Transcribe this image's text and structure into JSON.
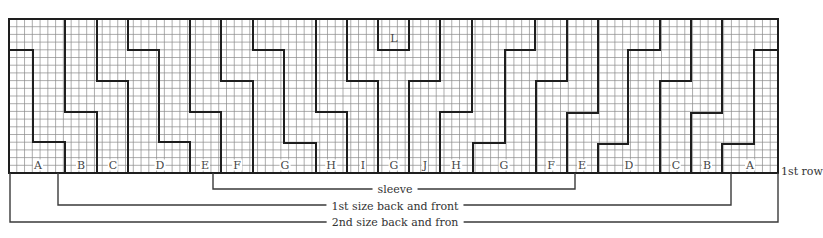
{
  "diagram": {
    "grid": {
      "x0": 9,
      "y0": 19,
      "x1": 778,
      "y1": 173,
      "cols": 99,
      "rows": 20,
      "line_color": "#8a8a8a",
      "heavy_color": "#1e1e1e"
    },
    "column_labels": [
      {
        "text": "A",
        "x": 38
      },
      {
        "text": "B",
        "x": 81
      },
      {
        "text": "C",
        "x": 113
      },
      {
        "text": "D",
        "x": 160
      },
      {
        "text": "E",
        "x": 205
      },
      {
        "text": "F",
        "x": 237
      },
      {
        "text": "G",
        "x": 285
      },
      {
        "text": "H",
        "x": 331
      },
      {
        "text": "I",
        "x": 363
      },
      {
        "text": "G",
        "x": 394
      },
      {
        "text": "J",
        "x": 425
      },
      {
        "text": "H",
        "x": 456
      },
      {
        "text": "G",
        "x": 504
      },
      {
        "text": "F",
        "x": 551
      },
      {
        "text": "E",
        "x": 582
      },
      {
        "text": "D",
        "x": 629
      },
      {
        "text": "C",
        "x": 676
      },
      {
        "text": "B",
        "x": 707
      },
      {
        "text": "A",
        "x": 750
      }
    ],
    "top_label": {
      "text": "L",
      "x": 394,
      "y": 38
    },
    "row_label": "1st row",
    "brackets": [
      {
        "name": "sleeve",
        "text": "sleeve"
      },
      {
        "name": "first-size",
        "text": "1st size back and front"
      },
      {
        "name": "second-size",
        "text": "2nd size back and fron"
      }
    ]
  }
}
